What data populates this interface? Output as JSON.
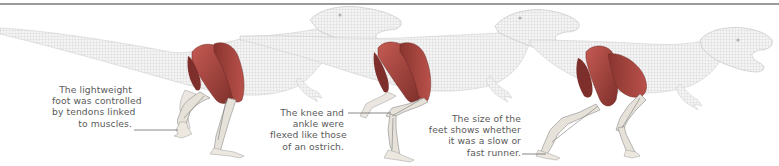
{
  "figure": {
    "colors": {
      "wireframe": "#c9c9c9",
      "wireframe_shade": "#dedede",
      "muscle": "#b24a44",
      "muscle_dark": "#7e2f2b",
      "bone": "#e6e2da",
      "leader_line": "#6a6a6a",
      "rule": "#9a9a9a"
    },
    "dinosaurs": [
      {
        "label": "Stage 1 - foot raised"
      },
      {
        "label": "Stage 2 - leg flexed"
      },
      {
        "label": "Stage 3 - stride"
      }
    ],
    "captions": [
      {
        "lines": [
          "The lightweight",
          "foot was controlled",
          "by tendons linked",
          "to muscles."
        ]
      },
      {
        "lines": [
          "The knee and",
          "ankle were",
          "flexed like those",
          "of an ostrich."
        ]
      },
      {
        "lines": [
          "The size of the",
          "feet shows whether",
          "it was a slow or",
          "fast runner."
        ]
      }
    ]
  }
}
